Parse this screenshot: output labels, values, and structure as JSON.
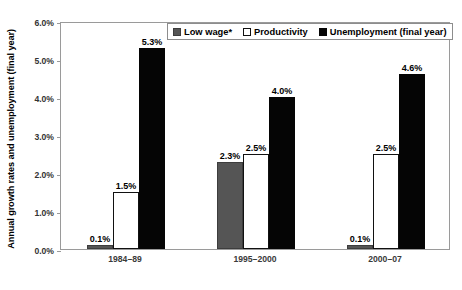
{
  "chart_data": {
    "type": "bar",
    "title": "",
    "subtitle": "",
    "xlabel": "",
    "ylabel": "Annual growth rates and unemployment (final year)",
    "ylim": [
      0.0,
      6.0
    ],
    "yticks": [
      "0.0%",
      "1.0%",
      "2.0%",
      "3.0%",
      "4.0%",
      "5.0%",
      "6.0%"
    ],
    "ytick_values": [
      0.0,
      1.0,
      2.0,
      3.0,
      4.0,
      5.0,
      6.0
    ],
    "grid": false,
    "legend_position": "top",
    "categories": [
      "1984–89",
      "1995–2000",
      "2000–07"
    ],
    "series": [
      {
        "name": "Low wage*",
        "color": "#555555",
        "values": [
          0.1,
          2.3,
          0.1
        ],
        "labels": [
          "0.1%",
          "2.3%",
          "0.1%"
        ]
      },
      {
        "name": "Productivity",
        "color": "#ffffff",
        "values": [
          1.5,
          2.5,
          2.5
        ],
        "labels": [
          "1.5%",
          "2.5%",
          "2.5%"
        ]
      },
      {
        "name": "Unemployment (final year)",
        "color": "#050505",
        "values": [
          5.3,
          4.0,
          4.6
        ],
        "labels": [
          "5.3%",
          "4.0%",
          "4.6%"
        ]
      }
    ]
  },
  "legend": {
    "items": [
      {
        "label": "Low wage*",
        "swatch": "s-lowwage"
      },
      {
        "label": "Productivity",
        "swatch": "s-prod"
      },
      {
        "label": "Unemployment (final year)",
        "swatch": "s-unemp"
      }
    ]
  },
  "footnote": ""
}
